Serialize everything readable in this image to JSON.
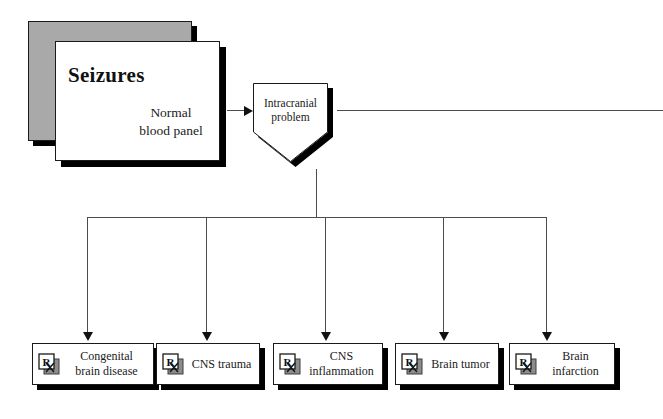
{
  "diagram": {
    "title": "Seizures",
    "subtitle": "Normal\nblood panel",
    "decision": {
      "label": "Intracranial\nproblem",
      "shape": "pentagon"
    },
    "outcomes": [
      {
        "label": "Congenital\nbrain disease",
        "icon": "rx-prescription-icon"
      },
      {
        "label": "CNS trauma",
        "icon": "rx-prescription-icon"
      },
      {
        "label": "CNS\ninflammation",
        "icon": "rx-prescription-icon"
      },
      {
        "label": "Brain tumor",
        "icon": "rx-prescription-icon"
      },
      {
        "label": "Brain\ninfarction",
        "icon": "rx-prescription-icon"
      }
    ],
    "colors": {
      "card_back": "#a9a9a9",
      "card_front": "#ffffff",
      "shadow": "#000000",
      "line": "#4d4d4d",
      "text": "#1a1a1a"
    }
  }
}
